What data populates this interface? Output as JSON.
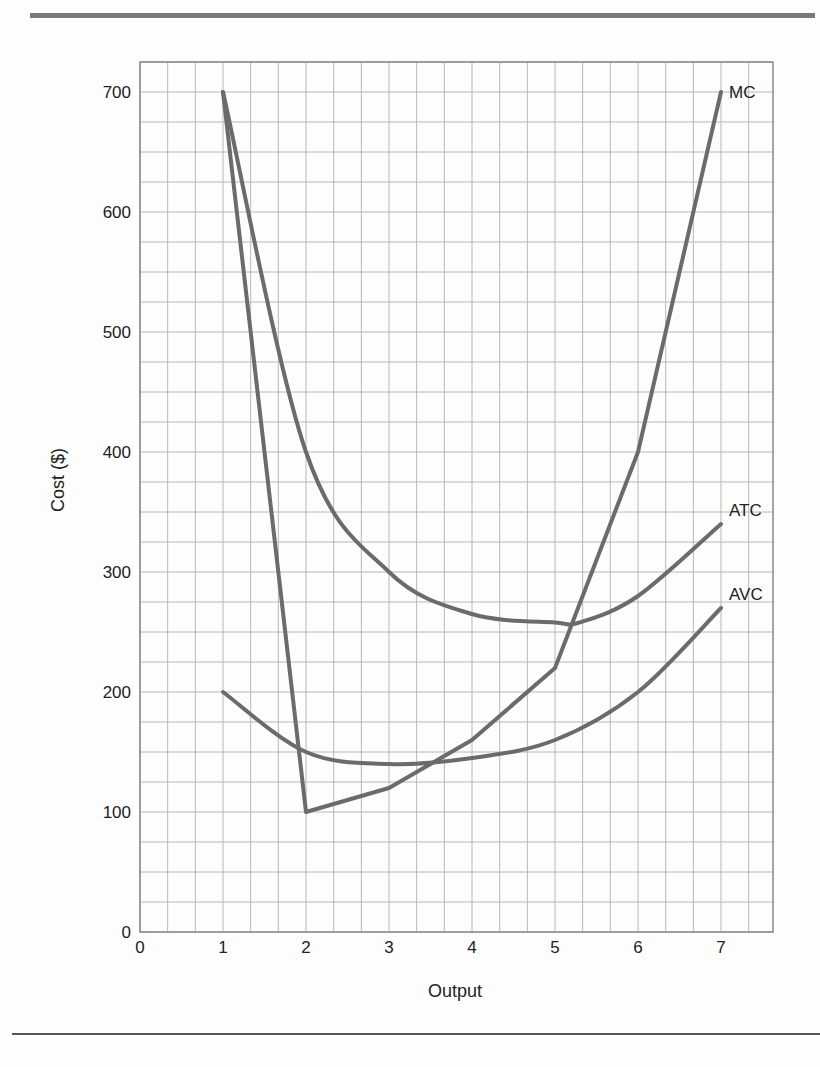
{
  "chart_data": {
    "type": "line",
    "title": "",
    "xlabel": "Output",
    "ylabel": "Cost ($)",
    "xlim": [
      0,
      7.33
    ],
    "ylim": [
      0,
      725
    ],
    "grid": true,
    "x_ticks": [
      "0",
      "1",
      "2",
      "3",
      "4",
      "5",
      "6",
      "7"
    ],
    "y_ticks": [
      "0",
      "100",
      "200",
      "300",
      "400",
      "500",
      "600",
      "700"
    ],
    "legend_position": "inline-right",
    "series": [
      {
        "name": "MC",
        "x": [
          1,
          2,
          3,
          4,
          5,
          6,
          7
        ],
        "values": [
          700,
          100,
          120,
          160,
          220,
          400,
          700
        ]
      },
      {
        "name": "ATC",
        "x": [
          1,
          2,
          3,
          4,
          5,
          5.3,
          6,
          7
        ],
        "values": [
          700,
          400,
          300,
          265,
          258,
          258,
          280,
          340
        ]
      },
      {
        "name": "AVC",
        "x": [
          1,
          2,
          3,
          4,
          5,
          6,
          7
        ],
        "values": [
          200,
          150,
          140,
          145,
          160,
          200,
          270
        ]
      }
    ],
    "colors": {
      "line": "#6b6b6b",
      "grid": "#b8b8b8",
      "axis": "#888888",
      "text": "#222222"
    }
  }
}
